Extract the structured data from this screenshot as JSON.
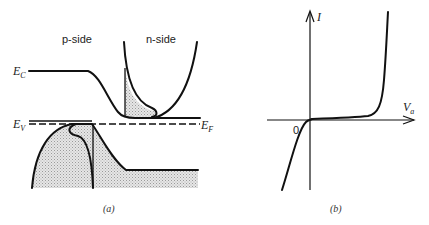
{
  "panel_a": {
    "p_side_label": "p-side",
    "n_side_label": "n-side",
    "ec_label": "E",
    "ec_sub": "C",
    "ev_label": "E",
    "ev_sub": "V",
    "ef_label": "E",
    "ef_sub": "F",
    "caption": "(a)"
  },
  "panel_b": {
    "y_axis_label": "I",
    "x_axis_label": "V",
    "x_axis_sub": "a",
    "origin_label": "0",
    "caption": "(b)"
  },
  "colors": {
    "stroke": "#111111",
    "fill": "#d4d4d4",
    "background": "#ffffff"
  }
}
